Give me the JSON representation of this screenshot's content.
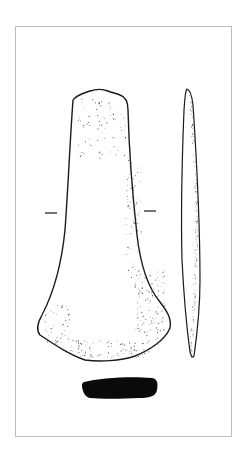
{
  "figure": {
    "views": [
      {
        "id": "front",
        "label": "front view (face)"
      },
      {
        "id": "side",
        "label": "side profile view"
      },
      {
        "id": "section",
        "label": "cross-section"
      }
    ],
    "section_marks": 2
  },
  "colors": {
    "background": "#ffffff",
    "frame": "#bdbdbd",
    "outline": "#1a1a1a",
    "stipple": "#555555",
    "section_fill": "#0a0a0a"
  }
}
